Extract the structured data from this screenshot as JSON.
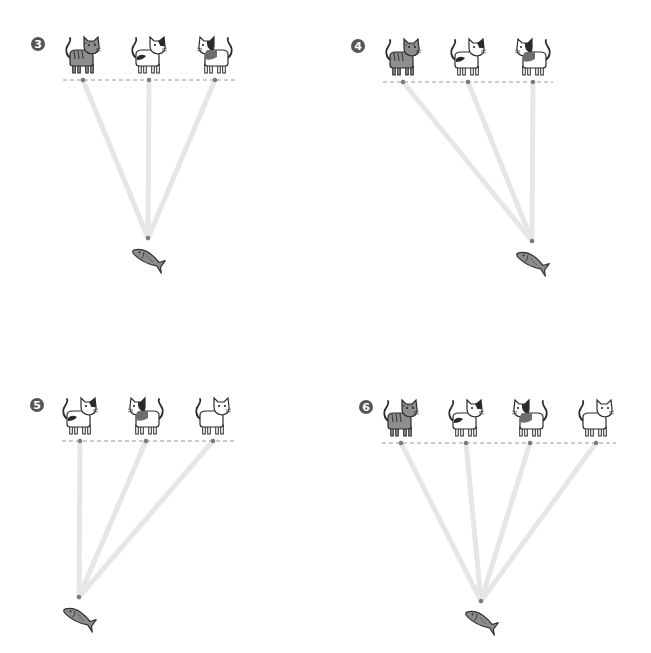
{
  "colors": {
    "badge": "#555555",
    "dashed_line": "#9a9a9a",
    "dot": "#7a7a7a",
    "beam": "#e6e6e6",
    "fish_fill": "#8c8c8c",
    "fish_stroke": "#333333",
    "cat_stroke": "#2b2b2b",
    "tabby_fill": "#8e8e8e",
    "patch_dark": "#2a2a2a",
    "patch_mid": "#6e6e6e",
    "cat_white": "#ffffff"
  },
  "panels": [
    {
      "number": "3",
      "badge": {
        "x": 38,
        "y": 44
      },
      "dashed_line": {
        "x1": 63,
        "x2": 236,
        "y": 80
      },
      "apex": {
        "x": 148,
        "y": 238
      },
      "fish": {
        "x": 148,
        "y": 258
      },
      "cats": [
        {
          "type": "tabby",
          "x": 83,
          "y": 56
        },
        {
          "type": "bicolor",
          "x": 149,
          "y": 56
        },
        {
          "type": "calico",
          "x": 215,
          "y": 56
        }
      ]
    },
    {
      "number": "4",
      "badge": {
        "x": 358,
        "y": 46
      },
      "dashed_line": {
        "x1": 383,
        "x2": 553,
        "y": 82
      },
      "apex": {
        "x": 532,
        "y": 241
      },
      "fish": {
        "x": 532,
        "y": 261
      },
      "cats": [
        {
          "type": "tabby",
          "x": 403,
          "y": 58
        },
        {
          "type": "bicolor",
          "x": 468,
          "y": 58
        },
        {
          "type": "calico",
          "x": 533,
          "y": 58
        }
      ]
    },
    {
      "number": "5",
      "badge": {
        "x": 37,
        "y": 405
      },
      "dashed_line": {
        "x1": 62,
        "x2": 234,
        "y": 441
      },
      "apex": {
        "x": 79,
        "y": 597
      },
      "fish": {
        "x": 79,
        "y": 617
      },
      "cats": [
        {
          "type": "bicolor",
          "x": 80,
          "y": 417
        },
        {
          "type": "calico",
          "x": 146,
          "y": 417
        },
        {
          "type": "white",
          "x": 213,
          "y": 417
        }
      ]
    },
    {
      "number": "6",
      "badge": {
        "x": 366,
        "y": 407
      },
      "dashed_line": {
        "x1": 382,
        "x2": 616,
        "y": 443
      },
      "apex": {
        "x": 481,
        "y": 601
      },
      "fish": {
        "x": 481,
        "y": 620
      },
      "cats": [
        {
          "type": "tabby",
          "x": 401,
          "y": 419
        },
        {
          "type": "bicolor",
          "x": 466,
          "y": 419
        },
        {
          "type": "calico",
          "x": 530,
          "y": 419
        },
        {
          "type": "white",
          "x": 596,
          "y": 419
        }
      ]
    }
  ]
}
